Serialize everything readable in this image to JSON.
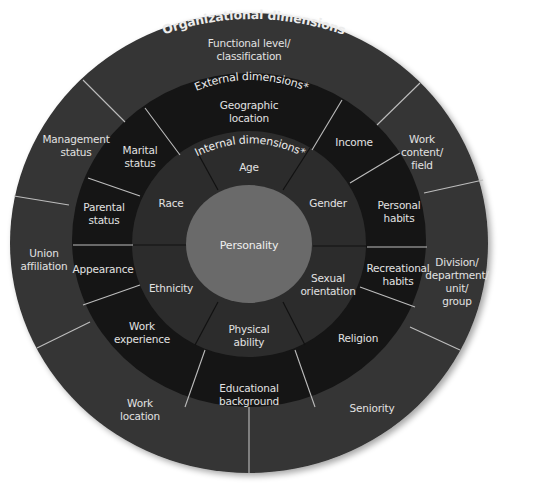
{
  "diagram": {
    "title_cutoff": "",
    "geometry": {
      "center": [
        249,
        244
      ],
      "outer": {
        "rx": 239,
        "ry": 230
      },
      "external": {
        "rx": 177,
        "ry": 167
      },
      "internal": {
        "rx": 117,
        "ry": 113
      },
      "core": {
        "rx": 63,
        "ry": 59
      }
    },
    "colors": {
      "background": "#ffffff",
      "outer_ring": "#343434",
      "external_ring": "#151515",
      "internal_ring": "#2c2c2c",
      "core": "#6a6a6a",
      "divider_light": "#bdbdbd",
      "divider_dark": "#111111",
      "text": "#e2e2e2"
    },
    "rings": {
      "organizational": {
        "title": "Organizational dimensions",
        "segments": [
          {
            "label": "Functional level/ classification",
            "lines": [
              "Functional level/",
              "classification"
            ],
            "pos": [
              249,
              50
            ]
          },
          {
            "label": "Work content/ field",
            "lines": [
              "Work",
              "content/",
              "field"
            ],
            "pos": [
              422,
              152
            ]
          },
          {
            "label": "Division/ department/ unit/ group",
            "lines": [
              "Division/",
              "department/",
              "unit/",
              "group"
            ],
            "pos": [
              457,
              282
            ]
          },
          {
            "label": "Seniority",
            "lines": [
              "Seniority"
            ],
            "pos": [
              372,
              408
            ]
          },
          {
            "label": "Work location",
            "lines": [
              "Work",
              "location"
            ],
            "pos": [
              140,
              410
            ]
          },
          {
            "label": "Union affiliation",
            "lines": [
              "Union",
              "affiliation"
            ],
            "pos": [
              44,
              260
            ]
          },
          {
            "label": "Management status",
            "lines": [
              "Management",
              "status"
            ],
            "pos": [
              76,
              146
            ]
          }
        ]
      },
      "external": {
        "title": "External dimensions*",
        "segments": [
          {
            "label": "Geographic location",
            "lines": [
              "Geographic",
              "location"
            ],
            "pos": [
              249,
              112
            ]
          },
          {
            "label": "Income",
            "lines": [
              "Income"
            ],
            "pos": [
              354,
              142
            ]
          },
          {
            "label": "Personal habits",
            "lines": [
              "Personal",
              "habits"
            ],
            "pos": [
              399,
              212
            ]
          },
          {
            "label": "Recreational habits",
            "lines": [
              "Recreational",
              "habits"
            ],
            "pos": [
              398,
              275
            ]
          },
          {
            "label": "Religion",
            "lines": [
              "Religion"
            ],
            "pos": [
              358,
              338
            ]
          },
          {
            "label": "Educational background",
            "lines": [
              "Educational",
              "background"
            ],
            "pos": [
              249,
              395
            ]
          },
          {
            "label": "Work experience",
            "lines": [
              "Work",
              "experience"
            ],
            "pos": [
              142,
              333
            ]
          },
          {
            "label": "Appearance",
            "lines": [
              "Appearance"
            ],
            "pos": [
              103,
              269
            ]
          },
          {
            "label": "Parental status",
            "lines": [
              "Parental",
              "status"
            ],
            "pos": [
              104,
              214
            ]
          },
          {
            "label": "Marital status",
            "lines": [
              "Marital",
              "status"
            ],
            "pos": [
              140,
              157
            ]
          }
        ]
      },
      "internal": {
        "title": "Internal dimensions*",
        "segments": [
          {
            "label": "Age",
            "lines": [
              "Age"
            ],
            "pos": [
              249,
              167
            ]
          },
          {
            "label": "Gender",
            "lines": [
              "Gender"
            ],
            "pos": [
              328,
              203
            ]
          },
          {
            "label": "Sexual orientation",
            "lines": [
              "Sexual",
              "orientation"
            ],
            "pos": [
              328,
              285
            ]
          },
          {
            "label": "Physical ability",
            "lines": [
              "Physical",
              "ability"
            ],
            "pos": [
              249,
              336
            ]
          },
          {
            "label": "Ethnicity",
            "lines": [
              "Ethnicity"
            ],
            "pos": [
              171,
              288
            ]
          },
          {
            "label": "Race",
            "lines": [
              "Race"
            ],
            "pos": [
              171,
              203
            ]
          }
        ]
      },
      "core": {
        "label": "Personality",
        "pos": [
          249,
          245
        ]
      }
    },
    "dividers": {
      "outer": [
        [
          83,
          80,
          125,
          122
        ],
        [
          420,
          83,
          377,
          125
        ],
        [
          424,
          193,
          483,
          180
        ],
        [
          410,
          327,
          460,
          350
        ],
        [
          249,
          407,
          249,
          473
        ],
        [
          90,
          322,
          37,
          348
        ],
        [
          69,
          205,
          14,
          196
        ]
      ],
      "external": [
        [
          145,
          108,
          180,
          155
        ],
        [
          342,
          100,
          312,
          150
        ],
        [
          400,
          153,
          350,
          183
        ],
        [
          367,
          247,
          427,
          247
        ],
        [
          360,
          287,
          415,
          307
        ],
        [
          295,
          350,
          315,
          407
        ],
        [
          205,
          350,
          185,
          407
        ],
        [
          140,
          285,
          83,
          305
        ],
        [
          73,
          245,
          133,
          245
        ],
        [
          88,
          178,
          140,
          196
        ]
      ],
      "internal": [
        [
          195,
          148,
          218,
          190
        ],
        [
          310,
          148,
          283,
          190
        ],
        [
          313,
          246,
          367,
          246
        ],
        [
          283,
          302,
          305,
          345
        ],
        [
          218,
          302,
          195,
          345
        ],
        [
          133,
          245,
          186,
          245
        ]
      ]
    }
  }
}
